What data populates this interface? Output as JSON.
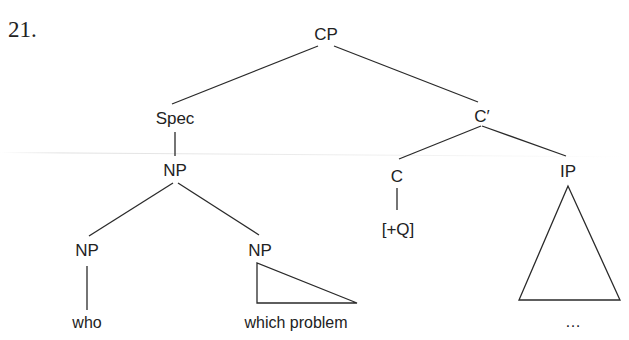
{
  "example": {
    "number": "21."
  },
  "tree": {
    "root": "CP",
    "spec": "Spec",
    "spec_np": "NP",
    "np_left": "NP",
    "np_left_leaf": "who",
    "np_right": "NP",
    "np_right_leaf": "which problem",
    "c_bar": "C′",
    "c_head": "C",
    "c_feature": "[+Q]",
    "ip": "IP",
    "ip_leaf": "…"
  },
  "style": {
    "ink_color": "#222222",
    "background": "#ffffff"
  }
}
